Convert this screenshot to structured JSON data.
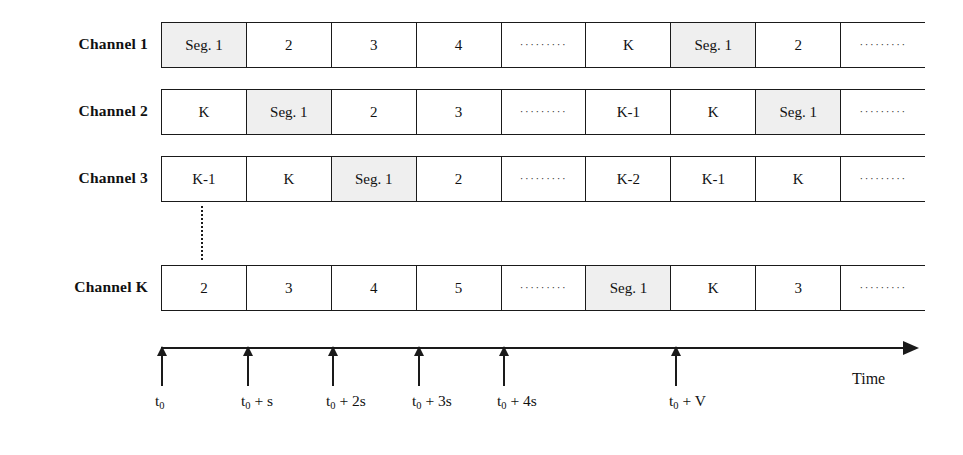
{
  "figure": {
    "axis": {
      "name": "Time",
      "ticks": [
        {
          "label_main": "t",
          "label_sub": "0",
          "label_rest": "",
          "x": 161
        },
        {
          "label_main": "t",
          "label_sub": "0",
          "label_rest": " + s",
          "x": 247
        },
        {
          "label_main": "t",
          "label_sub": "0",
          "label_rest": " + 2s",
          "x": 332
        },
        {
          "label_main": "t",
          "label_sub": "0",
          "label_rest": " + 3s",
          "x": 418
        },
        {
          "label_main": "t",
          "label_sub": "0",
          "label_rest": " + 4s",
          "x": 503
        },
        {
          "label_main": "t",
          "label_sub": "0",
          "label_rest": " + V",
          "x": 675
        }
      ]
    },
    "ellipsis_glyph": "·········",
    "shaded_color": "#efefef",
    "line_color": "#1a1a1a",
    "channels": [
      {
        "label": "Channel 1",
        "top": 22,
        "cells": [
          {
            "text": "Seg. 1",
            "shaded": true,
            "ellipsis": false
          },
          {
            "text": "2",
            "shaded": false,
            "ellipsis": false
          },
          {
            "text": "3",
            "shaded": false,
            "ellipsis": false
          },
          {
            "text": "4",
            "shaded": false,
            "ellipsis": false
          },
          {
            "text": "",
            "shaded": false,
            "ellipsis": true
          },
          {
            "text": "K",
            "shaded": false,
            "ellipsis": false
          },
          {
            "text": "Seg. 1",
            "shaded": true,
            "ellipsis": false
          },
          {
            "text": "2",
            "shaded": false,
            "ellipsis": false
          },
          {
            "text": "",
            "shaded": false,
            "ellipsis": true
          }
        ]
      },
      {
        "label": "Channel 2",
        "top": 89,
        "cells": [
          {
            "text": "K",
            "shaded": false,
            "ellipsis": false
          },
          {
            "text": "Seg. 1",
            "shaded": true,
            "ellipsis": false
          },
          {
            "text": "2",
            "shaded": false,
            "ellipsis": false
          },
          {
            "text": "3",
            "shaded": false,
            "ellipsis": false
          },
          {
            "text": "",
            "shaded": false,
            "ellipsis": true
          },
          {
            "text": "K-1",
            "shaded": false,
            "ellipsis": false
          },
          {
            "text": "K",
            "shaded": false,
            "ellipsis": false
          },
          {
            "text": "Seg. 1",
            "shaded": true,
            "ellipsis": false
          },
          {
            "text": "",
            "shaded": false,
            "ellipsis": true
          }
        ]
      },
      {
        "label": "Channel 3",
        "top": 156,
        "cells": [
          {
            "text": "K-1",
            "shaded": false,
            "ellipsis": false
          },
          {
            "text": "K",
            "shaded": false,
            "ellipsis": false
          },
          {
            "text": "Seg. 1",
            "shaded": true,
            "ellipsis": false
          },
          {
            "text": "2",
            "shaded": false,
            "ellipsis": false
          },
          {
            "text": "",
            "shaded": false,
            "ellipsis": true
          },
          {
            "text": "K-2",
            "shaded": false,
            "ellipsis": false
          },
          {
            "text": "K-1",
            "shaded": false,
            "ellipsis": false
          },
          {
            "text": "K",
            "shaded": false,
            "ellipsis": false
          },
          {
            "text": "",
            "shaded": false,
            "ellipsis": true
          }
        ]
      },
      {
        "label": "Channel K",
        "top": 265,
        "cells": [
          {
            "text": "2",
            "shaded": false,
            "ellipsis": false
          },
          {
            "text": "3",
            "shaded": false,
            "ellipsis": false
          },
          {
            "text": "4",
            "shaded": false,
            "ellipsis": false
          },
          {
            "text": "5",
            "shaded": false,
            "ellipsis": false
          },
          {
            "text": "",
            "shaded": false,
            "ellipsis": true
          },
          {
            "text": "Seg. 1",
            "shaded": true,
            "ellipsis": false
          },
          {
            "text": "K",
            "shaded": false,
            "ellipsis": false
          },
          {
            "text": "3",
            "shaded": false,
            "ellipsis": false
          },
          {
            "text": "",
            "shaded": false,
            "ellipsis": true
          }
        ]
      }
    ]
  }
}
